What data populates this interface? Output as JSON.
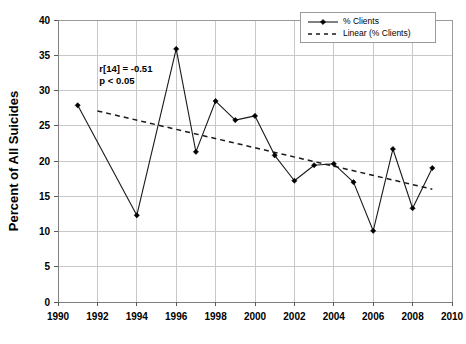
{
  "chart_data": {
    "type": "line",
    "title": "",
    "subtitle": "",
    "xlabel": "",
    "ylabel": "Percent of All Suicides",
    "xlim": [
      1990,
      2010
    ],
    "ylim": [
      0,
      40
    ],
    "xticks": [
      1990,
      1992,
      1994,
      1996,
      1998,
      2000,
      2002,
      2004,
      2006,
      2008,
      2010
    ],
    "yticks": [
      0,
      5,
      10,
      15,
      20,
      25,
      30,
      35,
      40
    ],
    "grid": true,
    "legend_position": "top-right",
    "x": [
      1991,
      1994,
      1996,
      1997,
      1998,
      1999,
      2000,
      2001,
      2002,
      2003,
      2004,
      2005,
      2006,
      2007,
      2008,
      2009
    ],
    "series": [
      {
        "name": "% Clients",
        "style": "solid-with-diamond-markers",
        "values": [
          27.9,
          12.3,
          35.9,
          21.3,
          28.5,
          25.8,
          26.4,
          20.8,
          17.2,
          19.4,
          19.6,
          17.0,
          10.1,
          21.7,
          13.3,
          19.0
        ]
      },
      {
        "name": "Linear (% Clients)",
        "style": "dashed-trendline",
        "x_endpoints": [
          1992,
          2009
        ],
        "y_endpoints": [
          27.1,
          16.0
        ]
      }
    ],
    "annotations": [
      {
        "line1": "r[14] = -0.51",
        "line2": "p < 0.05",
        "x": 1992.1,
        "y": 32.6
      }
    ]
  },
  "legend": {
    "entries": [
      {
        "label": "% Clients"
      },
      {
        "label": "Linear (% Clients)"
      }
    ]
  },
  "annotation": {
    "correlation": "r[14] = -0.51",
    "significance": "p < 0.05"
  },
  "colors": {
    "series": "#1a1a1a",
    "grid": "#c8c8c8",
    "axis": "#7f7f7f",
    "background": "#ffffff"
  }
}
